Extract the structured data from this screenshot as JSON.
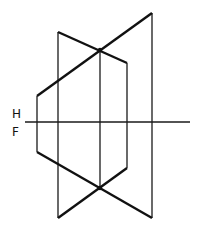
{
  "diagram": {
    "type": "orthographic-projection",
    "fold_line": {
      "label_top": "H",
      "label_bottom": "F",
      "y": 122,
      "x1": 25,
      "x2": 190
    },
    "colors": {
      "line": "#111111",
      "background": "#ffffff"
    },
    "top_view": {
      "thick_lines": [
        {
          "name": "line-ab-top",
          "x1": 37,
          "y1": 96,
          "x2": 152,
          "y2": 13
        },
        {
          "name": "line-cd-top",
          "x1": 58,
          "y1": 32,
          "x2": 127,
          "y2": 63
        }
      ],
      "intersection": {
        "x": 100,
        "y": 50
      }
    },
    "front_view": {
      "thick_lines": [
        {
          "name": "line-ab-front",
          "x1": 37,
          "y1": 152,
          "x2": 152,
          "y2": 218
        },
        {
          "name": "line-cd-front",
          "x1": 58,
          "y1": 218,
          "x2": 127,
          "y2": 168
        }
      ],
      "intersection": {
        "x": 100,
        "y": 188
      }
    },
    "projectors": [
      {
        "name": "projector-a",
        "x": 37,
        "y1": 96,
        "y2": 152
      },
      {
        "name": "projector-c",
        "x": 58,
        "y1": 32,
        "y2": 218
      },
      {
        "name": "projector-intersection",
        "x": 100,
        "y1": 50,
        "y2": 188
      },
      {
        "name": "projector-d",
        "x": 127,
        "y1": 63,
        "y2": 168
      },
      {
        "name": "projector-b",
        "x": 152,
        "y1": 13,
        "y2": 218
      }
    ]
  }
}
